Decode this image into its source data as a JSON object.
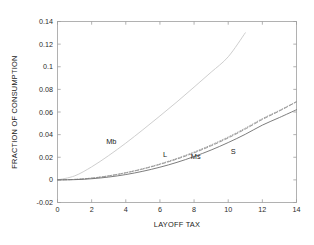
{
  "chart_data": {
    "type": "line",
    "title": "",
    "xlabel": "LAYOFF TAX",
    "ylabel": "FRACTION OF CONSUMPTION",
    "xlim": [
      0,
      14
    ],
    "ylim": [
      -0.02,
      0.14
    ],
    "xticks": [
      0,
      2,
      4,
      6,
      8,
      10,
      12,
      14
    ],
    "xtick_labels": [
      "0",
      "2",
      "4",
      "6",
      "8",
      "10",
      "12",
      "14"
    ],
    "yticks": [
      -0.02,
      0,
      0.02,
      0.04,
      0.06,
      0.08,
      0.1,
      0.12,
      0.14
    ],
    "ytick_labels": [
      "-0.02",
      "0",
      "0.02",
      "0.04",
      "0.06",
      "0.08",
      "0.1",
      "0.12",
      "0.14"
    ],
    "grid": false,
    "legend_position": "inline-annotations",
    "series": [
      {
        "name": "Mb",
        "style": "solid",
        "color": "#c8c8c8",
        "width": 0.9,
        "x": [
          0,
          1,
          2,
          3,
          4,
          5,
          6,
          7,
          8,
          9,
          10,
          11
        ],
        "y": [
          0,
          0.0035,
          0.0115,
          0.0215,
          0.0325,
          0.0443,
          0.0565,
          0.069,
          0.082,
          0.0952,
          0.1088,
          0.13
        ]
      },
      {
        "name": "L",
        "style": "dashed",
        "color": "#8c8c8c",
        "width": 0.9,
        "x": [
          0,
          1,
          2,
          3,
          4,
          5,
          6,
          7,
          8,
          9,
          10,
          11,
          12,
          13,
          14
        ],
        "y": [
          0,
          0.0004,
          0.0015,
          0.0035,
          0.0062,
          0.0096,
          0.0137,
          0.0184,
          0.0239,
          0.0301,
          0.0371,
          0.0449,
          0.0534,
          0.0609,
          0.069
        ]
      },
      {
        "name": "Ms",
        "style": "dotted",
        "color": "#9a9a9a",
        "width": 0.9,
        "x": [
          0,
          1,
          2,
          3,
          4,
          5,
          6,
          7,
          8,
          9,
          10,
          11,
          12,
          13,
          14
        ],
        "y": [
          0,
          0.0004,
          0.0016,
          0.0036,
          0.0064,
          0.0099,
          0.0141,
          0.019,
          0.0246,
          0.0309,
          0.0379,
          0.0457,
          0.0541,
          0.0614,
          0.0692
        ]
      },
      {
        "name": "S",
        "style": "solid",
        "color": "#6e6e6e",
        "width": 0.9,
        "x": [
          0,
          1,
          2,
          3,
          4,
          5,
          6,
          7,
          8,
          9,
          10,
          11,
          12,
          13,
          14
        ],
        "y": [
          0,
          0.0002,
          0.001,
          0.0025,
          0.0047,
          0.0076,
          0.0112,
          0.0155,
          0.0206,
          0.0264,
          0.033,
          0.0403,
          0.0484,
          0.0551,
          0.062
        ]
      }
    ],
    "annotations": [
      {
        "text": "Mb",
        "x": 3.15,
        "y": 0.0315
      },
      {
        "text": "L",
        "x": 6.3,
        "y": 0.02
      },
      {
        "text": "Ms",
        "x": 8.1,
        "y": 0.0185
      },
      {
        "text": "S",
        "x": 10.3,
        "y": 0.0225
      }
    ],
    "axis_color": "#9e9e9e",
    "text_color": "#1a1a1a",
    "background": "#ffffff"
  }
}
